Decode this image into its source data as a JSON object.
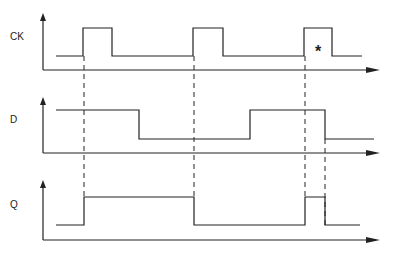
{
  "diagram": {
    "type": "timing-diagram",
    "signals": [
      {
        "name": "CK",
        "label_pos": [
          10,
          37
        ],
        "axis_y": 70,
        "axis_top": 13,
        "high_y": 28,
        "low_y": 56,
        "points": [
          [
            56,
            56
          ],
          [
            83,
            56
          ],
          [
            83,
            28
          ],
          [
            112,
            28
          ],
          [
            112,
            56
          ],
          [
            193,
            56
          ],
          [
            193,
            28
          ],
          [
            223,
            28
          ],
          [
            223,
            56
          ],
          [
            304,
            56
          ],
          [
            304,
            28
          ],
          [
            332,
            28
          ],
          [
            332,
            56
          ],
          [
            362,
            56
          ]
        ]
      },
      {
        "name": "D",
        "label_pos": [
          10,
          120
        ],
        "axis_y": 153,
        "axis_top": 97,
        "high_y": 110,
        "low_y": 139,
        "points": [
          [
            56,
            110
          ],
          [
            139,
            110
          ],
          [
            139,
            139
          ],
          [
            250,
            139
          ],
          [
            250,
            110
          ],
          [
            325,
            110
          ],
          [
            325,
            139
          ],
          [
            374,
            139
          ]
        ]
      },
      {
        "name": "Q",
        "label_pos": [
          10,
          205
        ],
        "axis_y": 240,
        "axis_top": 180,
        "high_y": 197,
        "low_y": 225,
        "points": [
          [
            56,
            225
          ],
          [
            84,
            225
          ],
          [
            84,
            197
          ],
          [
            194,
            197
          ],
          [
            194,
            225
          ],
          [
            305,
            225
          ],
          [
            305,
            197
          ],
          [
            325,
            197
          ],
          [
            325,
            225
          ],
          [
            360,
            225
          ]
        ]
      }
    ],
    "dashed_lines": [
      {
        "x": 84,
        "y1": 56,
        "y2": 197
      },
      {
        "x": 194,
        "y1": 56,
        "y2": 197
      },
      {
        "x": 305,
        "y1": 56,
        "y2": 197
      },
      {
        "x": 325,
        "y1": 139,
        "y2": 225
      }
    ],
    "annotation": {
      "text": "*",
      "x": 318,
      "y": 57
    },
    "axis_x_start": 43,
    "axis_x_end": 380,
    "stroke_color": "#222222"
  }
}
